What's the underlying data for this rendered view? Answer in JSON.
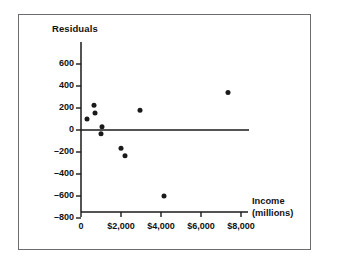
{
  "chart_data": {
    "type": "scatter",
    "title": "",
    "ylabel": "Residuals",
    "xlabel": "Income",
    "xlabel_line2": "(millions)",
    "xlabel_full": "Income (millions)",
    "xlim": [
      -400,
      9200
    ],
    "ylim": [
      -850,
      760
    ],
    "grid": false,
    "legend": null,
    "xticks": [
      0,
      2000,
      4000,
      6000,
      8000
    ],
    "xtick_labels": [
      "0",
      "$2,000",
      "$4,000",
      "$6,000",
      "$8,000"
    ],
    "yticks": [
      600,
      400,
      200,
      0,
      -200,
      -400,
      -600,
      -800
    ],
    "ytick_labels": [
      "600",
      "400",
      "200",
      "0",
      "–200",
      "–400",
      "–600",
      "–800"
    ],
    "points": [
      {
        "x": 300,
        "y": 100
      },
      {
        "x": 650,
        "y": 225
      },
      {
        "x": 700,
        "y": 155
      },
      {
        "x": 1050,
        "y": 30
      },
      {
        "x": 1000,
        "y": -35
      },
      {
        "x": 2000,
        "y": -165
      },
      {
        "x": 2200,
        "y": -235
      },
      {
        "x": 2950,
        "y": 180
      },
      {
        "x": 4150,
        "y": -600
      },
      {
        "x": 7350,
        "y": 340
      }
    ],
    "reference_line": {
      "y": 0,
      "x_start": 0,
      "x_end": 8400
    },
    "marker_color": "#1a1a1a",
    "axis_color": "#1a1a1a",
    "frame_color": "#6b6b70",
    "background_color": "#ffffff"
  }
}
